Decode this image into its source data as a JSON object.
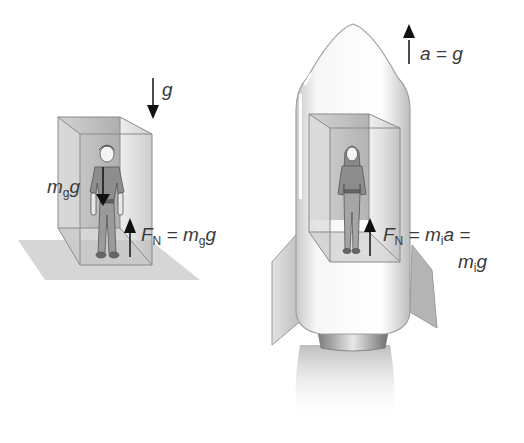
{
  "figure": {
    "left_scene": {
      "name": "person on Earth in room",
      "gravity_label": "g",
      "weight_label": {
        "m": "m",
        "sub": "g",
        "g": "g"
      },
      "normal_label": {
        "F": "F",
        "sub": "N",
        "eq": " = ",
        "m": "m",
        "msub": "g",
        "g": "g"
      }
    },
    "right_scene": {
      "name": "person in accelerating rocket",
      "accel_label": "a = g",
      "normal_label": {
        "F": "F",
        "sub": "N",
        "eq": " = ",
        "m": "m",
        "msub": "i",
        "a": "a =",
        "line2_m": "m",
        "line2_sub": "i",
        "line2_g": "g"
      }
    },
    "colors": {
      "box_edge": "#8a8a8a",
      "box_fill": "#d4d4d4",
      "floor": "#cfcfcf",
      "rocket_body": "#f4f4f4",
      "rocket_outline": "#a0a0a0",
      "arrow": "#111111",
      "text": "#3a3a3a"
    }
  }
}
